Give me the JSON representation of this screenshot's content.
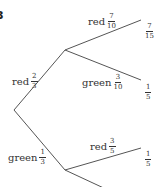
{
  "question_number": "3",
  "tree": {
    "first_branches": [
      {
        "color": "red",
        "numerator": "2",
        "denominator": "3"
      },
      {
        "color": "green",
        "numerator": "1",
        "denominator": "3"
      }
    ],
    "second_branches_after_red": [
      {
        "color": "red",
        "numerator": "7",
        "denominator": "10",
        "outcome_numerator": "7",
        "outcome_denominator": "15"
      },
      {
        "color": "green",
        "numerator": "3",
        "denominator": "10",
        "outcome_numerator": "1",
        "outcome_denominator": "5"
      }
    ],
    "second_branches_after_green": [
      {
        "color": "red",
        "numerator": "3",
        "denominator": "5",
        "outcome_numerator": "1",
        "outcome_denominator": "5"
      }
    ]
  },
  "style": {
    "line_color": "#555555",
    "text_color": "#333333"
  }
}
